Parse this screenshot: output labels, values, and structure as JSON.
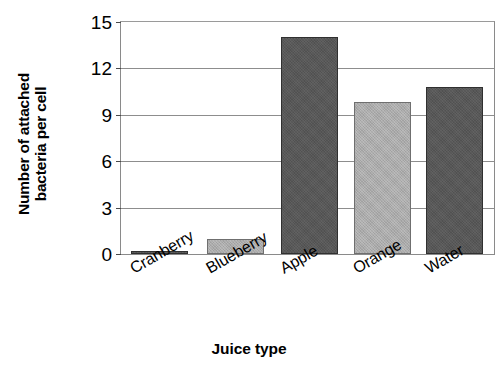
{
  "chart_data": {
    "type": "bar",
    "title": "",
    "xlabel": "Juice type",
    "ylabel_line1": "Number of attached",
    "ylabel_line2": "bacteria per cell",
    "ylabel": "Number of attached bacteria per cell",
    "categories": [
      "Cranberry",
      "Blueberry",
      "Apple",
      "Orange",
      "Water"
    ],
    "values": [
      0.2,
      1.0,
      14.0,
      9.8,
      10.8
    ],
    "ylim": [
      0,
      15
    ],
    "yticks": [
      0,
      3,
      6,
      9,
      12,
      15
    ],
    "ytick_labels": [
      "0",
      "3",
      "6",
      "9",
      "12",
      "15"
    ],
    "grid": true,
    "legend": "none",
    "bar_styles": [
      "dark",
      "light",
      "dark",
      "light",
      "dark"
    ],
    "colors": {
      "bar_dark": "#585858",
      "bar_light": "#ababab",
      "bar_outline": "#3c3c3c",
      "gridline": "#8d8d8d",
      "axis": "#8a8a8a",
      "text": "#000000",
      "background": "#ffffff"
    }
  }
}
